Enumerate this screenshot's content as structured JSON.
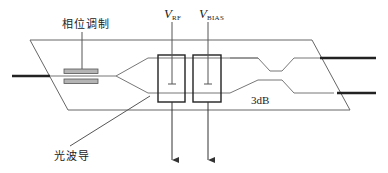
{
  "diagram": {
    "type": "electro-optic Mach-Zehnder modulator schematic",
    "labels": {
      "phase_modulation": "相位调制",
      "optical_waveguide": "光波导",
      "coupler": "3dB",
      "v_rf_main": "V",
      "v_rf_sub": "RF",
      "v_bias_main": "V",
      "v_bias_sub": "BIAS"
    },
    "colors": {
      "line": "#555555",
      "fiber": "#222222",
      "modulator_bar_fill": "#b4b4b4",
      "modulator_bar_stroke": "#555555",
      "electrode": "#222222",
      "text": "#222222"
    },
    "components": [
      {
        "id": "input-fiber",
        "kind": "fiber"
      },
      {
        "id": "phase-modulator",
        "kind": "electrode-pair"
      },
      {
        "id": "y-splitter",
        "kind": "waveguide-branch"
      },
      {
        "id": "rf-electrode",
        "kind": "electrode",
        "label": "V_RF"
      },
      {
        "id": "bias-electrode",
        "kind": "electrode",
        "label": "V_BIAS"
      },
      {
        "id": "3db-coupler",
        "kind": "directional-coupler",
        "label": "3dB"
      },
      {
        "id": "output-fiber-upper",
        "kind": "fiber"
      },
      {
        "id": "output-fiber-lower",
        "kind": "fiber"
      },
      {
        "id": "substrate",
        "kind": "parallelogram-chip"
      }
    ]
  }
}
